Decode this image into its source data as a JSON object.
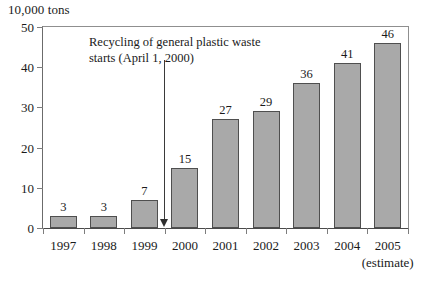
{
  "chart_data": {
    "type": "bar",
    "title": "",
    "xlabel": "",
    "ylabel": "10,000 tons",
    "unit_caption": "10,000 tons",
    "categories": [
      "1997",
      "1998",
      "1999",
      "2000",
      "2001",
      "2002",
      "2003",
      "2004",
      "2005"
    ],
    "category_sublabels": [
      "",
      "",
      "",
      "",
      "",
      "",
      "",
      "",
      "(estimate)"
    ],
    "values": [
      3,
      3,
      7,
      15,
      27,
      29,
      36,
      41,
      46
    ],
    "value_labels": [
      "3",
      "3",
      "7",
      "15",
      "27",
      "29",
      "36",
      "41",
      "46"
    ],
    "ylim": [
      0,
      50
    ],
    "yticks": [
      0,
      10,
      20,
      30,
      40,
      50
    ],
    "ytick_labels": [
      "0",
      "10",
      "20",
      "30",
      "40",
      "50"
    ],
    "grid": false,
    "legend": null,
    "bar_color": "#a9a9a9",
    "bar_edge_color": "#4f4f4f",
    "annotations": [
      {
        "text": "Recycling of general plastic waste\nstarts (April 1, 2000)",
        "points_to_x": "between 1999 and 2000",
        "marker": "down-arrow"
      }
    ]
  },
  "axes": {
    "unit_caption": "10,000 tons",
    "y_tick_labels": [
      "50",
      "40",
      "30",
      "20",
      "10",
      "0"
    ],
    "x_tick_labels": [
      "1997",
      "1998",
      "1999",
      "2000",
      "2001",
      "2002",
      "2003",
      "2004",
      "2005"
    ],
    "x_sub_label": "(estimate)"
  },
  "annotation": {
    "line1": "Recycling of general plastic waste",
    "line2": "starts (April 1, 2000)"
  }
}
